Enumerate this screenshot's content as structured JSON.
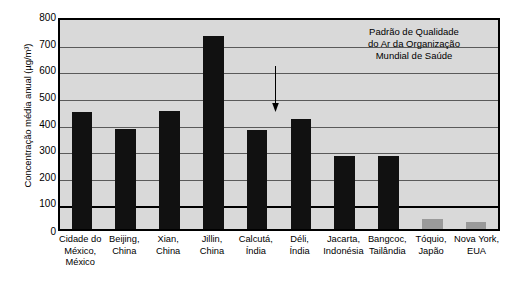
{
  "chart_data": {
    "type": "bar",
    "title": "",
    "xlabel": "",
    "ylabel": "Concentração média anual (µg/m³)",
    "ylim": [
      0,
      800
    ],
    "ytick_step": 100,
    "yticks": [
      "800",
      "700",
      "600",
      "500",
      "400",
      "300",
      "200",
      "100",
      "0"
    ],
    "grid": true,
    "legend": "none",
    "categories": [
      "Cidade do México, México",
      "Beijing, China",
      "Xian, China",
      "Jillin, China",
      "Calcutá, Índia",
      "Déli, Índia",
      "Jacarta, Indonésia",
      "Bangcoc, Tailândia",
      "Tóquio, Japão",
      "Nova York, EUA"
    ],
    "category_lines": [
      [
        "Cidade do",
        "México,",
        "México"
      ],
      [
        "Beijing,",
        "China"
      ],
      [
        "Xian,",
        "China"
      ],
      [
        "Jillin,",
        "China"
      ],
      [
        "Calcutá,",
        "Índia"
      ],
      [
        "Déli,",
        "Índia"
      ],
      [
        "Jacarta,",
        "Indonésia"
      ],
      [
        "Bangcoc,",
        "Tailândia"
      ],
      [
        "Tóquio,",
        "Japão"
      ],
      [
        "Nova York,",
        "EUA"
      ]
    ],
    "values": [
      438,
      375,
      442,
      725,
      372,
      412,
      273,
      275,
      38,
      28
    ],
    "bar_colors": [
      "#111111",
      "#111111",
      "#111111",
      "#111111",
      "#111111",
      "#111111",
      "#111111",
      "#111111",
      "#9a9a9a",
      "#9a9a9a"
    ],
    "annotations": [
      {
        "lines": [
          "Padrão de Qualidade",
          "do Ar da Organização",
          "Mundial de Saúde"
        ],
        "value": 100,
        "marker": "bold-horizontal-line-with-down-arrow"
      }
    ],
    "reference_line": {
      "value": 100,
      "style": "bold",
      "color": "#000000"
    }
  },
  "colors": {
    "plot_background": "#d9d9d9",
    "frame": "#000000",
    "gridline": "#5a5a5a",
    "bar_dark": "#111111",
    "bar_light": "#9a9a9a"
  }
}
